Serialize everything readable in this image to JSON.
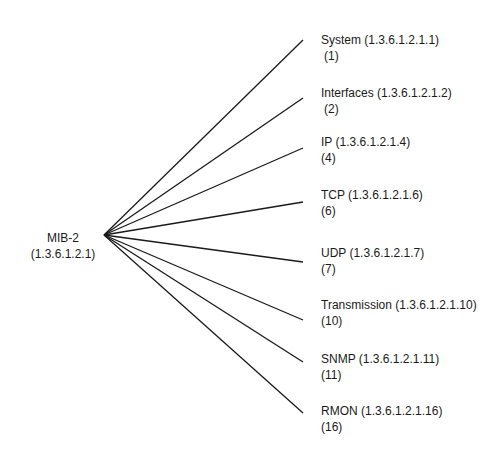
{
  "root": {
    "name": "MIB-2",
    "oid": "(1.3.6.1.2.1)",
    "anchor": [
      104,
      235
    ]
  },
  "children": [
    {
      "label": "System (1.3.6.1.2.1.1)",
      "num": "(1)",
      "line_end": [
        303,
        40
      ],
      "label_top": 32
    },
    {
      "label": "Interfaces (1.3.6.1.2.1.2)",
      "num": "(2)",
      "line_end": [
        303,
        98
      ],
      "label_top": 85
    },
    {
      "label": "IP (1.3.6.1.2.1.4)",
      "num": "(4)",
      "line_end": [
        303,
        148
      ],
      "label_top": 134
    },
    {
      "label": "TCP (1.3.6.1.2.1.6)",
      "num": "(6)",
      "line_end": [
        303,
        202
      ],
      "label_top": 187
    },
    {
      "label": "UDP (1.3.6.1.2.1.7)",
      "num": "(7)",
      "line_end": [
        303,
        262
      ],
      "label_top": 245
    },
    {
      "label": "Transmission (1.3.6.1.2.1.10)",
      "num": "(10)",
      "line_end": [
        303,
        320
      ],
      "label_top": 297
    },
    {
      "label": "SNMP (1.3.6.1.2.1.11)",
      "num": "(11)",
      "line_end": [
        303,
        362
      ],
      "label_top": 351
    },
    {
      "label": "RMON (1.3.6.1.2.1.16)",
      "num": "(16)",
      "line_end": [
        303,
        413
      ],
      "label_top": 403
    }
  ],
  "colors": {
    "line": "#1a1a1a",
    "text": "#1a1a1a",
    "background": "#ffffff"
  }
}
